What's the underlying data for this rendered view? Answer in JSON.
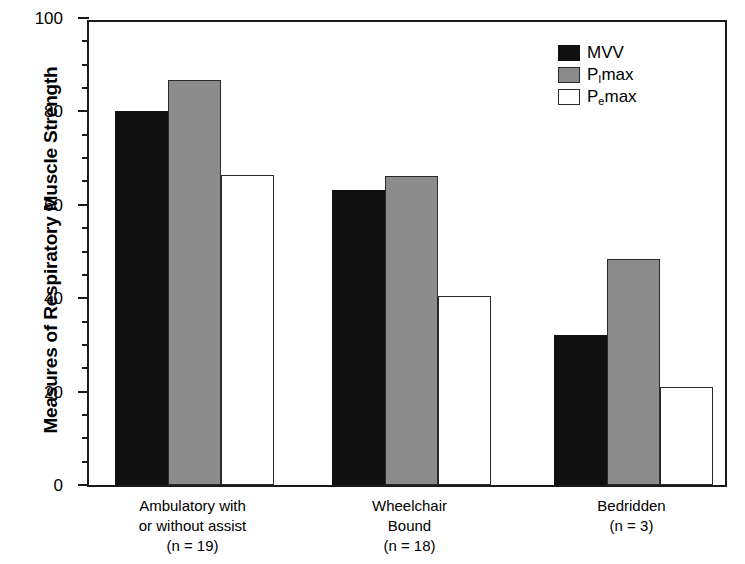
{
  "chart_data": {
    "type": "bar",
    "title": "",
    "xlabel": "",
    "ylabel": "Measures of Respiratory Muscle Strength",
    "ylim": [
      0,
      100
    ],
    "ytick_labels": [
      "0",
      "20",
      "40",
      "60",
      "80",
      "100"
    ],
    "ytick_values": [
      0,
      20,
      40,
      60,
      80,
      100
    ],
    "minor_ticks_per_interval": 3,
    "grid": false,
    "legend_position": "top-right",
    "categories": [
      "Ambulatory with or without assist (n = 19)",
      "Wheelchair Bound (n = 18)",
      "Bedridden (n = 3)"
    ],
    "category_lines": [
      [
        "Ambulatory with",
        "or without assist",
        "(n = 19)"
      ],
      [
        "Wheelchair",
        "Bound",
        "(n = 18)"
      ],
      [
        "Bedridden",
        "(n = 3)"
      ]
    ],
    "series": [
      {
        "name": "MVV",
        "color": "#101010",
        "values": [
          80.0,
          63.2,
          32.1
        ]
      },
      {
        "name": "PImax",
        "color": "#8c8c8c",
        "values": [
          86.7,
          66.2,
          48.4
        ]
      },
      {
        "name": "PEmax",
        "color": "#ffffff",
        "values": [
          66.4,
          40.5,
          21.0
        ]
      }
    ]
  },
  "legend": {
    "items": [
      {
        "label_main": "MVV",
        "label_sub": "",
        "label_tail": "",
        "swatch": "mvv"
      },
      {
        "label_main": "P",
        "label_sub": "I",
        "label_tail": "max",
        "swatch": "pimax"
      },
      {
        "label_main": "P",
        "label_sub": "e",
        "label_tail": "max",
        "swatch": "pemax"
      }
    ]
  },
  "axis": {
    "y_title": "Measures of Respiratory Muscle Strength"
  }
}
